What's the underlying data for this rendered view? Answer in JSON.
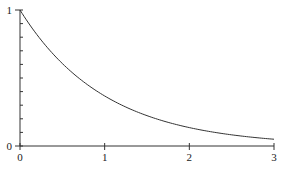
{
  "chart_data": {
    "type": "line",
    "title": "",
    "xlabel": "",
    "ylabel": "",
    "xlim": [
      0,
      3
    ],
    "ylim": [
      0,
      1
    ],
    "grid": false,
    "legend": null,
    "function": "y = e^(-x)",
    "x_ticks": [
      "0",
      "1",
      "2",
      "3"
    ],
    "y_ticks": [
      "0",
      "1"
    ],
    "y_minor_tick_step": 0.1,
    "series": [
      {
        "name": "exp(-x)",
        "color": "#333333",
        "x": [
          0,
          0.25,
          0.5,
          0.75,
          1.0,
          1.25,
          1.5,
          1.75,
          2.0,
          2.25,
          2.5,
          2.75,
          3.0
        ],
        "values": [
          1.0,
          0.779,
          0.607,
          0.472,
          0.368,
          0.287,
          0.223,
          0.174,
          0.135,
          0.105,
          0.082,
          0.064,
          0.05
        ]
      }
    ]
  },
  "axes": {
    "x_labels": [
      "0",
      "1",
      "2",
      "3"
    ],
    "y_labels": [
      "0",
      "1"
    ],
    "line_color": "#333333"
  }
}
